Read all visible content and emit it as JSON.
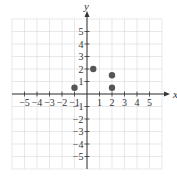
{
  "chart_data": {
    "type": "scatter",
    "title": "",
    "xlabel": "x",
    "ylabel": "y",
    "xlim": [
      -6,
      6
    ],
    "ylim": [
      -6,
      6
    ],
    "grid": true,
    "xticks": [
      -5,
      -4,
      -3,
      -2,
      -1,
      1,
      2,
      3,
      4,
      5
    ],
    "yticks": [
      -5,
      -4,
      -3,
      -2,
      -1,
      1,
      2,
      3,
      4,
      5
    ],
    "xtick_labels": [
      "−5",
      "−4",
      "−3",
      "−2",
      "−1",
      "1",
      "2",
      "3",
      "4",
      "5"
    ],
    "ytick_labels": [
      "−5",
      "−4",
      "−3",
      "−2",
      "−1",
      "1",
      "2",
      "3",
      "4",
      "5"
    ],
    "series": [
      {
        "name": "points",
        "color": "#555555",
        "points": [
          {
            "x": -1,
            "y": 0.5
          },
          {
            "x": 0.5,
            "y": 2
          },
          {
            "x": 2,
            "y": 1.5
          },
          {
            "x": 2,
            "y": 0.5
          }
        ]
      }
    ]
  }
}
